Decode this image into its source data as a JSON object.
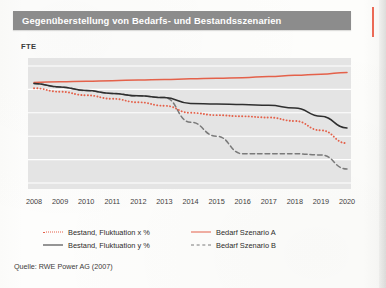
{
  "figure": {
    "title": "Gegenüberstellung von Bedarfs- und Bestandsszenarien",
    "unit_label": "FTE",
    "source": "Quelle: RWE Power AG (2007)"
  },
  "colors": {
    "title_bar": "#8c8c8c",
    "plot_background": "#e4e4e4",
    "gridline": "#ffffff",
    "series_red": "#e4614a",
    "series_black": "#2f2f2f",
    "series_gray_dashed": "#7a7a7a",
    "page_background": "#fdfdfb",
    "accent": "#e8503a"
  },
  "legend": {
    "items": [
      {
        "label": "Bestand, Fluktuation x %",
        "style": "dotted",
        "color": "#e4614a",
        "column": 0,
        "row": 0
      },
      {
        "label": "Bestand, Fluktuation y %",
        "style": "solid",
        "color": "#2f2f2f",
        "column": 0,
        "row": 1
      },
      {
        "label": "Bedarf Szenario A",
        "style": "solid",
        "color": "#e4614a",
        "column": 1,
        "row": 0
      },
      {
        "label": "Bedarf Szenario B",
        "style": "dashed",
        "color": "#7a7a7a",
        "column": 1,
        "row": 1
      }
    ]
  },
  "chart_data": {
    "type": "line",
    "title": "Gegenüberstellung von Bedarfs- und Bestandsszenarien",
    "xlabel": "",
    "ylabel": "FTE",
    "ylim": [
      0,
      100
    ],
    "yticks_visible": false,
    "grid": true,
    "gridlines_horizontal": 6,
    "legend_position": "bottom",
    "categories": [
      2008,
      2009,
      2010,
      2011,
      2012,
      2013,
      2014,
      2015,
      2016,
      2017,
      2018,
      2019,
      2020
    ],
    "series": [
      {
        "name": "Bedarf Szenario A",
        "style": "solid",
        "color": "#e4614a",
        "values": [
          86,
          86.5,
          87,
          87.5,
          88,
          88.5,
          89,
          89.5,
          90,
          91,
          92,
          93,
          94.5
        ]
      },
      {
        "name": "Bestand, Fluktuation y %",
        "style": "solid",
        "color": "#2f2f2f",
        "values": [
          85,
          82,
          79,
          76.5,
          74.5,
          73,
          68,
          67.5,
          67,
          66.5,
          64,
          57,
          47
        ]
      },
      {
        "name": "Bestand, Fluktuation x %",
        "style": "dotted",
        "color": "#e4614a",
        "values": [
          81,
          78,
          75,
          72,
          69,
          66,
          60,
          58,
          57,
          56,
          53,
          45,
          34
        ]
      },
      {
        "name": "Bedarf Szenario B",
        "style": "dashed",
        "color": "#7a7a7a",
        "values": [
          85,
          82,
          79,
          76.5,
          74.5,
          73,
          52,
          40,
          25,
          25,
          25,
          24,
          12
        ]
      }
    ]
  }
}
